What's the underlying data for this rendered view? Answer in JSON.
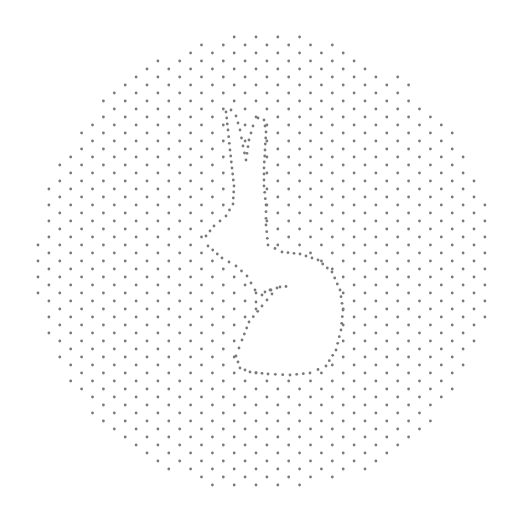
{
  "image": {
    "subject": "Rabbit silhouette formed by negative space in a circular stippled dot pattern",
    "background": "#ffffff",
    "dot_color": "#7a7a7a",
    "dot_radius": 1.4
  },
  "circle": {
    "cx": 265,
    "cy": 263,
    "r": 229
  },
  "grid": {
    "col_spacing": 10.9,
    "row_spacing": 16,
    "col_offset_y": 8,
    "origin_x": 38,
    "origin_y": 5
  },
  "rabbit_outline": [
    [
      226,
      112
    ],
    [
      231,
      110
    ],
    [
      236,
      116
    ],
    [
      240,
      130
    ],
    [
      243,
      146
    ],
    [
      246,
      160
    ],
    [
      249,
      140
    ],
    [
      253,
      126
    ],
    [
      258,
      118
    ],
    [
      264,
      120
    ],
    [
      266,
      132
    ],
    [
      265,
      150
    ],
    [
      264,
      168
    ],
    [
      264,
      186
    ],
    [
      266,
      205
    ],
    [
      266,
      225
    ],
    [
      268,
      245
    ],
    [
      282,
      252
    ],
    [
      300,
      254
    ],
    [
      318,
      260
    ],
    [
      332,
      272
    ],
    [
      340,
      290
    ],
    [
      343,
      310
    ],
    [
      341,
      330
    ],
    [
      336,
      350
    ],
    [
      326,
      366
    ],
    [
      310,
      373
    ],
    [
      290,
      375
    ],
    [
      268,
      374
    ],
    [
      250,
      372
    ],
    [
      240,
      368
    ],
    [
      236,
      356
    ],
    [
      242,
      340
    ],
    [
      249,
      322
    ],
    [
      262,
      306
    ],
    [
      277,
      288
    ],
    [
      265,
      292
    ],
    [
      255,
      290
    ],
    [
      247,
      276
    ],
    [
      236,
      266
    ],
    [
      222,
      258
    ],
    [
      208,
      246
    ],
    [
      206,
      236
    ],
    [
      214,
      226
    ],
    [
      226,
      216
    ],
    [
      233,
      204
    ],
    [
      234,
      186
    ],
    [
      232,
      168
    ],
    [
      230,
      150
    ],
    [
      228,
      130
    ]
  ],
  "haunch_line": [
    [
      256,
      302
    ],
    [
      262,
      295
    ],
    [
      270,
      290
    ],
    [
      280,
      287
    ],
    [
      292,
      286
    ]
  ],
  "outline_dot_spacing": 7
}
